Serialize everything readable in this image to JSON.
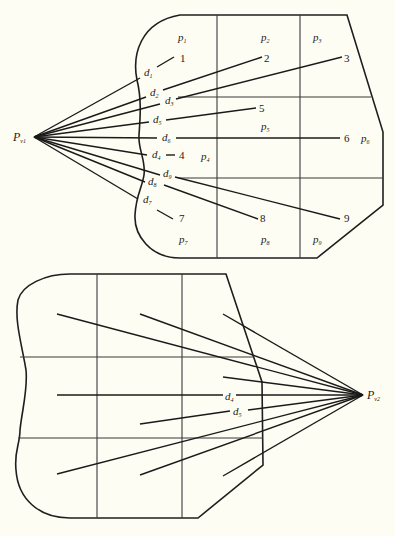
{
  "diagrams": [
    {
      "name": "top",
      "viewpoint": {
        "label": "P",
        "sub": "v1",
        "x": 34,
        "y": 137
      },
      "cells": [
        {
          "label": "p",
          "sub": "1",
          "x": 180,
          "y": 40
        },
        {
          "label": "p",
          "sub": "2",
          "x": 262,
          "y": 40
        },
        {
          "label": "p",
          "sub": "3",
          "x": 314,
          "y": 40
        },
        {
          "label": "p",
          "sub": "4",
          "x": 202,
          "y": 158
        },
        {
          "label": "p",
          "sub": "5",
          "x": 262,
          "y": 129
        },
        {
          "label": "p",
          "sub": "6",
          "x": 362,
          "y": 141
        },
        {
          "label": "p",
          "sub": "7",
          "x": 179,
          "y": 242
        },
        {
          "label": "p",
          "sub": "8",
          "x": 262,
          "y": 242
        },
        {
          "label": "p",
          "sub": "9",
          "x": 314,
          "y": 242
        }
      ],
      "points": [
        {
          "num": "1",
          "x": 181,
          "y": 59,
          "d": "d",
          "dsub": "1",
          "dx": 144,
          "dy": 75
        },
        {
          "num": "2",
          "x": 262,
          "y": 59,
          "d": "d",
          "dsub": "2",
          "dx": 150,
          "dy": 96
        },
        {
          "num": "3",
          "x": 346,
          "y": 59,
          "d": "d",
          "dsub": "3",
          "dx": 165,
          "dy": 103
        },
        {
          "num": "5",
          "x": 262,
          "y": 110,
          "d": "d",
          "dsub": "5",
          "dx": 153,
          "dy": 122
        },
        {
          "num": "6",
          "x": 345,
          "y": 141,
          "d": "d",
          "dsub": "6",
          "dx": 162,
          "dy": 141
        },
        {
          "num": "4",
          "x": 180,
          "y": 159,
          "d": "d",
          "dsub": "4",
          "dx": 152,
          "dy": 159
        },
        {
          "num": "9",
          "x": 345,
          "y": 223,
          "d": "d",
          "dsub": "9",
          "dx": 163,
          "dy": 177
        },
        {
          "num": "8",
          "x": 262,
          "y": 223,
          "d": "d",
          "dsub": "8",
          "dx": 148,
          "dy": 185
        },
        {
          "num": "7",
          "x": 180,
          "y": 221,
          "d": "d",
          "dsub": "7",
          "dx": 144,
          "dy": 203
        }
      ]
    },
    {
      "name": "bottom",
      "viewpoint": {
        "label": "P",
        "sub": "v2",
        "x": 363,
        "y": 395
      },
      "labels": [
        {
          "d": "d",
          "dsub": "4",
          "x": 229,
          "y": 400
        },
        {
          "d": "d",
          "dsub": "5",
          "x": 236,
          "y": 415
        }
      ]
    }
  ]
}
